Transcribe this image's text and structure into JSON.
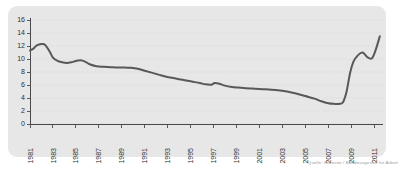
{
  "caption": "Quelle: Eurostat / Bundesagentur für Arbeit",
  "colors": {
    "panel_background": "#e7e7e7",
    "page_background": "#ffffff",
    "line": "#585858",
    "gridline": "#cfcfcf",
    "axis": "#4a4a4a",
    "tick_text": "#2f2f2f",
    "caption_text": "#9a9a9a"
  },
  "chart_data": {
    "type": "line",
    "title": "",
    "subtitle": "",
    "xlabel": "",
    "ylabel": "",
    "grid": true,
    "legend": false,
    "legend_position": "none",
    "xlim": [
      1981,
      2011.6
    ],
    "ylim": [
      0,
      16
    ],
    "ytick_values": [
      0,
      2,
      4,
      6,
      8,
      10,
      12,
      14,
      16
    ],
    "ytick_labels": [
      "0",
      "2",
      "4",
      "6",
      "8",
      "10",
      "12",
      "14",
      "16"
    ],
    "xtick_values": [
      1981,
      1983,
      1985,
      1987,
      1989,
      1991,
      1993,
      1995,
      1997,
      1999,
      2001,
      2003,
      2005,
      2007,
      2009,
      2011
    ],
    "xtick_labels": [
      "1981",
      "1983",
      "1985",
      "1987",
      "1989",
      "1991",
      "1993",
      "1995",
      "1997",
      "1999",
      "2001",
      "2003",
      "2005",
      "2007",
      "2009",
      "2011"
    ],
    "xtick_label_rotation": -90,
    "series": [
      {
        "name": "value",
        "color": "#585858",
        "x": [
          1981.0,
          1981.3,
          1981.6,
          1982.0,
          1982.3,
          1982.7,
          1983.0,
          1983.4,
          1983.8,
          1984.2,
          1984.6,
          1985.0,
          1985.4,
          1985.8,
          1986.2,
          1986.8,
          1987.4,
          1988.0,
          1988.6,
          1989.2,
          1989.8,
          1990.4,
          1991.0,
          1991.6,
          1992.2,
          1992.8,
          1993.4,
          1994.0,
          1994.6,
          1995.2,
          1995.8,
          1996.3,
          1996.8,
          1997.1,
          1997.5,
          1998.0,
          1998.6,
          1999.2,
          1999.8,
          2000.4,
          2001.0,
          2001.8,
          2002.6,
          2003.4,
          2004.2,
          2005.0,
          2005.8,
          2006.4,
          2007.0,
          2007.5,
          2008.0,
          2008.3,
          2008.6,
          2008.9,
          2009.2,
          2009.6,
          2010.0,
          2010.4,
          2010.8,
          2011.1,
          2011.5
        ],
        "y": [
          11.3,
          11.6,
          12.1,
          12.3,
          12.2,
          11.2,
          10.2,
          9.7,
          9.5,
          9.4,
          9.5,
          9.7,
          9.8,
          9.6,
          9.2,
          8.9,
          8.8,
          8.75,
          8.7,
          8.7,
          8.65,
          8.5,
          8.2,
          7.9,
          7.6,
          7.3,
          7.1,
          6.9,
          6.7,
          6.5,
          6.3,
          6.1,
          6.05,
          6.3,
          6.2,
          5.9,
          5.7,
          5.6,
          5.5,
          5.45,
          5.4,
          5.3,
          5.2,
          5.0,
          4.7,
          4.3,
          3.9,
          3.5,
          3.2,
          3.1,
          3.1,
          3.4,
          5.0,
          7.8,
          9.6,
          10.6,
          11.0,
          10.3,
          10.1,
          11.2,
          13.5
        ]
      }
    ],
    "annotations": []
  }
}
